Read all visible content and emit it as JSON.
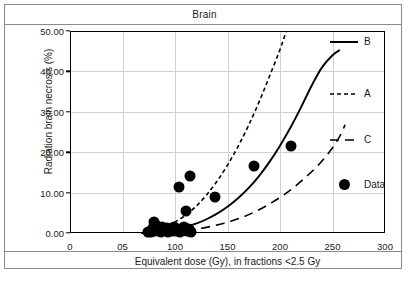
{
  "chart_data": {
    "type": "scatter",
    "title": "Brain",
    "xlabel": "Equivalent dose (Gy), in fractions <2.5 Gy",
    "ylabel": "Radiation brain necrosis (%)",
    "xlim": [
      0,
      300
    ],
    "ylim": [
      0,
      50
    ],
    "grid": true,
    "legend_position": "right",
    "x_ticks": [
      {
        "value": 0,
        "label": "0"
      },
      {
        "value": 50,
        "label": "05"
      },
      {
        "value": 100,
        "label": "100"
      },
      {
        "value": 150,
        "label": "150"
      },
      {
        "value": 200,
        "label": "200"
      },
      {
        "value": 250,
        "label": "250"
      },
      {
        "value": 300,
        "label": "300"
      }
    ],
    "y_ticks": [
      {
        "value": 0,
        "label": "0.00"
      },
      {
        "value": 10,
        "label": "10.00"
      },
      {
        "value": 20,
        "label": "20.00"
      },
      {
        "value": 30,
        "label": "30.00"
      },
      {
        "value": 40,
        "label": "40.00"
      },
      {
        "value": 50,
        "label": "50.00"
      }
    ],
    "legend": [
      {
        "name": "B",
        "style": "solid",
        "color": "#000000"
      },
      {
        "name": "A",
        "style": "fine-dashed",
        "color": "#000000"
      },
      {
        "name": "C",
        "style": "long-dashed",
        "color": "#000000"
      },
      {
        "name": "Data",
        "style": "marker-circle",
        "color": "#000000"
      }
    ],
    "series": [
      {
        "name": "A",
        "style": "fine-dashed",
        "points": [
          [
            68,
            0.0
          ],
          [
            80,
            0.6
          ],
          [
            90,
            1.4
          ],
          [
            100,
            2.7
          ],
          [
            110,
            4.4
          ],
          [
            120,
            6.6
          ],
          [
            130,
            9.4
          ],
          [
            140,
            12.8
          ],
          [
            150,
            16.8
          ],
          [
            160,
            21.4
          ],
          [
            170,
            26.6
          ],
          [
            180,
            32.4
          ],
          [
            190,
            38.8
          ],
          [
            200,
            45.4
          ],
          [
            206,
            50.0
          ]
        ]
      },
      {
        "name": "B",
        "style": "solid",
        "points": [
          [
            68,
            0.0
          ],
          [
            90,
            0.5
          ],
          [
            100,
            0.9
          ],
          [
            110,
            1.5
          ],
          [
            120,
            2.3
          ],
          [
            130,
            3.4
          ],
          [
            140,
            4.8
          ],
          [
            150,
            6.5
          ],
          [
            160,
            8.6
          ],
          [
            170,
            11.1
          ],
          [
            180,
            14.1
          ],
          [
            190,
            17.6
          ],
          [
            200,
            21.6
          ],
          [
            210,
            26.1
          ],
          [
            220,
            31.1
          ],
          [
            230,
            36.4
          ],
          [
            240,
            41.0
          ],
          [
            250,
            44.0
          ],
          [
            257,
            45.3
          ]
        ]
      },
      {
        "name": "C",
        "style": "long-dashed",
        "points": [
          [
            68,
            0.0
          ],
          [
            100,
            0.4
          ],
          [
            115,
            0.8
          ],
          [
            130,
            1.4
          ],
          [
            145,
            2.3
          ],
          [
            160,
            3.5
          ],
          [
            175,
            5.1
          ],
          [
            190,
            7.2
          ],
          [
            205,
            9.7
          ],
          [
            220,
            12.8
          ],
          [
            235,
            16.4
          ],
          [
            248,
            20.4
          ],
          [
            257,
            24.0
          ],
          [
            262,
            26.8
          ]
        ]
      }
    ],
    "data_points": [
      [
        74,
        0.3
      ],
      [
        77,
        0.2
      ],
      [
        79,
        1.3
      ],
      [
        80,
        2.6
      ],
      [
        81,
        0.4
      ],
      [
        83,
        1.8
      ],
      [
        84,
        0.9
      ],
      [
        86,
        1.1
      ],
      [
        87,
        0.3
      ],
      [
        88,
        1.6
      ],
      [
        90,
        0.7
      ],
      [
        92,
        1.2
      ],
      [
        93,
        0.2
      ],
      [
        95,
        1.0
      ],
      [
        97,
        0.6
      ],
      [
        99,
        1.4
      ],
      [
        101,
        0.4
      ],
      [
        103,
        1.0
      ],
      [
        105,
        0.2
      ],
      [
        107,
        0.9
      ],
      [
        109,
        1.5
      ],
      [
        111,
        0.5
      ],
      [
        113,
        1.1
      ],
      [
        115,
        0.3
      ],
      [
        104,
        11.3
      ],
      [
        114,
        14.0
      ],
      [
        110,
        5.5
      ],
      [
        138,
        9.0
      ],
      [
        175,
        16.7
      ],
      [
        210,
        21.6
      ]
    ]
  }
}
